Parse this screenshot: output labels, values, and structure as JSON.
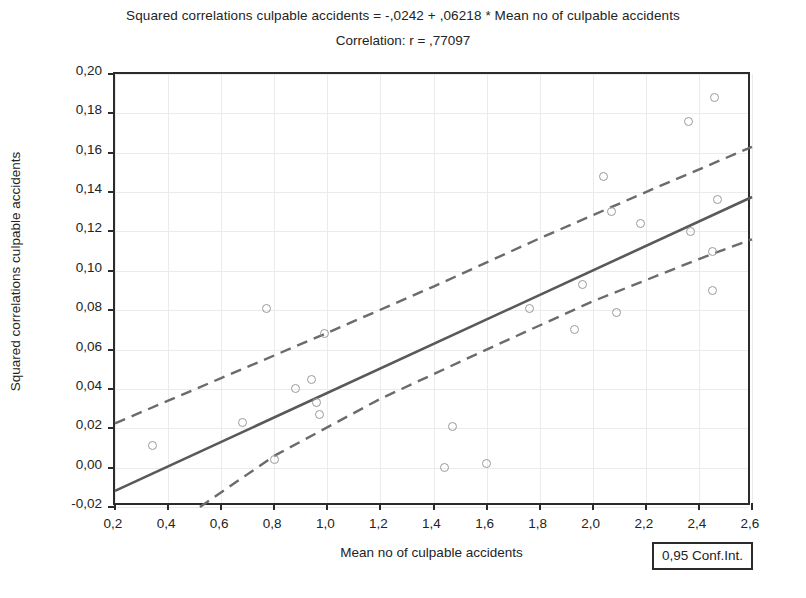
{
  "title": {
    "equation": "Squared correlations culpable accidents = -,0242 + ,06218 * Mean no of culpable accidents",
    "correlation": "Correlation: r = ,77097"
  },
  "axes": {
    "x_title": "Mean no of culpable accidents",
    "y_title": "Squared correlations culpable accidents",
    "x_ticks": [
      "0,2",
      "0,4",
      "0,6",
      "0,8",
      "1,0",
      "1,2",
      "1,4",
      "1,6",
      "1,8",
      "2,0",
      "2,2",
      "2,4",
      "2,6"
    ],
    "y_ticks": [
      "0,20",
      "0,18",
      "0,16",
      "0,14",
      "0,12",
      "0,10",
      "0,08",
      "0,06",
      "0,04",
      "0,02",
      "0,00",
      "-0,02"
    ]
  },
  "legend": {
    "conf_int_label": "0,95 Conf.Int."
  },
  "colors": {
    "frame": "#2b2b2b",
    "regression_line": "#595959",
    "confidence_band": "#6b6b6b",
    "marker_stroke": "#9a9a9a",
    "gridline": "#eceaea",
    "text": "#232323"
  },
  "chart_data": {
    "type": "scatter",
    "title": "Squared correlations culpable accidents = -,0242 + ,06218 * Mean no of culpable accidents",
    "subtitle": "Correlation: r = ,77097",
    "xlabel": "Mean no of culpable accidents",
    "ylabel": "Squared correlations culpable accidents",
    "xlim": [
      0.2,
      2.6
    ],
    "ylim": [
      -0.02,
      0.2
    ],
    "xtick_values": [
      0.2,
      0.4,
      0.6,
      0.8,
      1.0,
      1.2,
      1.4,
      1.6,
      1.8,
      2.0,
      2.2,
      2.4,
      2.6
    ],
    "ytick_values": [
      -0.02,
      0.0,
      0.02,
      0.04,
      0.06,
      0.08,
      0.1,
      0.12,
      0.14,
      0.16,
      0.18,
      0.2
    ],
    "grid": true,
    "legend_position": "bottom-right",
    "correlation_r": 0.77097,
    "regression": {
      "intercept": -0.0242,
      "slope": 0.06218,
      "line_endpoints": [
        [
          0.2,
          -0.0118
        ],
        [
          2.6,
          0.1375
        ]
      ]
    },
    "confidence_interval": {
      "level": 0.95,
      "upper_band": [
        [
          0.2,
          0.0225
        ],
        [
          0.6,
          0.0455
        ],
        [
          1.0,
          0.0685
        ],
        [
          1.4,
          0.092
        ],
        [
          1.8,
          0.1165
        ],
        [
          2.2,
          0.14
        ],
        [
          2.6,
          0.163
        ]
      ],
      "lower_band": [
        [
          0.52,
          -0.02
        ],
        [
          0.8,
          0.006
        ],
        [
          1.2,
          0.035
        ],
        [
          1.6,
          0.06
        ],
        [
          2.0,
          0.0845
        ],
        [
          2.4,
          0.106
        ],
        [
          2.6,
          0.116
        ]
      ]
    },
    "points": [
      {
        "x": 0.34,
        "y": 0.011
      },
      {
        "x": 0.68,
        "y": 0.023
      },
      {
        "x": 0.77,
        "y": 0.081
      },
      {
        "x": 0.8,
        "y": 0.004
      },
      {
        "x": 0.88,
        "y": 0.04
      },
      {
        "x": 0.94,
        "y": 0.045
      },
      {
        "x": 0.96,
        "y": 0.033
      },
      {
        "x": 0.97,
        "y": 0.027
      },
      {
        "x": 0.99,
        "y": 0.068
      },
      {
        "x": 1.44,
        "y": 0.0
      },
      {
        "x": 1.47,
        "y": 0.021
      },
      {
        "x": 1.6,
        "y": 0.002
      },
      {
        "x": 1.76,
        "y": 0.081
      },
      {
        "x": 1.93,
        "y": 0.07
      },
      {
        "x": 1.96,
        "y": 0.093
      },
      {
        "x": 2.04,
        "y": 0.148
      },
      {
        "x": 2.07,
        "y": 0.13
      },
      {
        "x": 2.09,
        "y": 0.079
      },
      {
        "x": 2.18,
        "y": 0.124
      },
      {
        "x": 2.36,
        "y": 0.176
      },
      {
        "x": 2.37,
        "y": 0.12
      },
      {
        "x": 2.45,
        "y": 0.09
      },
      {
        "x": 2.45,
        "y": 0.11
      },
      {
        "x": 2.46,
        "y": 0.188
      },
      {
        "x": 2.47,
        "y": 0.136
      }
    ]
  }
}
